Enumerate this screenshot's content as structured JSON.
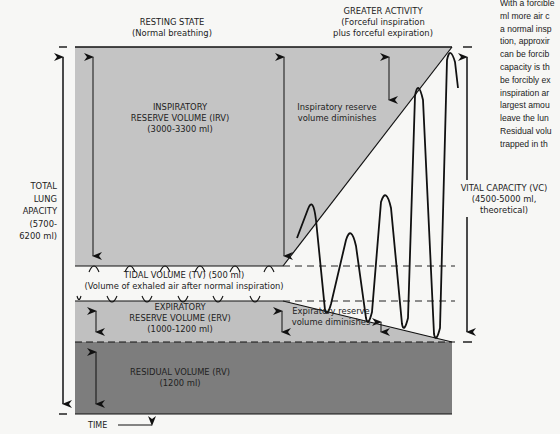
{
  "headers": {
    "resting": {
      "title": "RESTING STATE",
      "subtitle": "(Normal breathing)"
    },
    "activity": {
      "title": "GREATER ACTIVITY",
      "line1": "(Forceful inspiration",
      "line2": "plus forceful expiration)"
    }
  },
  "regions": {
    "irv": {
      "line1": "INSPIRATORY",
      "line2": "RESERVE VOLUME (IRV)",
      "line3": "(3000-3300 ml)"
    },
    "tv": {
      "line1": "TIDAL VOLUME (TV) (500 ml)",
      "line2": "(Volume of exhaled air after normal inspiration)"
    },
    "erv": {
      "line1": "EXPIRATORY",
      "line2": "RESERVE VOLUME (ERV)",
      "line3": "(1000-1200 ml)"
    },
    "rv": {
      "line1": "RESIDUAL VOLUME (RV)",
      "line2": "(1200 ml)"
    }
  },
  "annotations": {
    "irv_diminishes": {
      "line1": "Inspiratory reserve",
      "line2": "volume diminishes"
    },
    "erv_diminishes": {
      "line1": "Expiratory reserve",
      "line2": "volume diminishes"
    }
  },
  "total_lung_capacity": {
    "line1": "TOTAL",
    "line2": "LUNG",
    "line3": "APACITY",
    "line4": "(5700-",
    "line5": "6200 ml)"
  },
  "vital_capacity": {
    "line1": "VITAL CAPACITY (VC)",
    "line2": "(4500-5000 ml,",
    "line3": "theoretical)"
  },
  "time_axis": {
    "label": "TIME"
  },
  "side_text": [
    "With a forcible",
    "ml more air c",
    "a normal insp",
    "tion, approxir",
    "can be forcib",
    "capacity is th",
    "be forcibly ex",
    "inspiration ar",
    "largest amou",
    "leave the lun",
    "Residual volu",
    "trapped in th"
  ],
  "colors": {
    "irv_fill": "#c4c4c4",
    "erv_fill": "#c0c0c0",
    "rv_fill": "#7d7d7d",
    "line": "#111111",
    "background": "#f7f7f5"
  }
}
